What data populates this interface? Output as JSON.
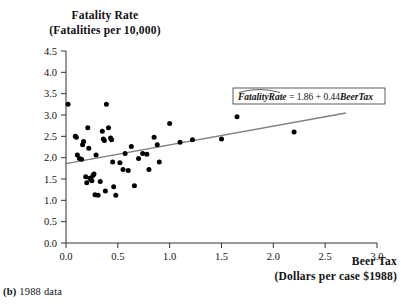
{
  "figure": {
    "caption_label": "(b)",
    "caption_text": "1988 data"
  },
  "axis_titles": {
    "y_line1": "Fatality Rate",
    "y_line2": "(Fatalities per 10,000)",
    "x_line1": "Beer Tax",
    "x_line2": "(Dollars per case $1988)"
  },
  "annotation": {
    "equation_lhs": "FatalityRate",
    "equation_rhs": " = 1.86 + 0.44",
    "equation_var": "BeerTax",
    "equation_full": "FatalityRate = 1.86 + 0.44BeerTax",
    "intercept": 1.86,
    "slope": 0.44
  },
  "colors": {
    "point": "#000000",
    "line": "#808080",
    "axis": "#333333",
    "background": "#ffffff"
  },
  "chart_data": {
    "type": "scatter",
    "title": "Fatality Rate (Fatalities per 10,000)",
    "xlabel": "Beer Tax (Dollars per case $1988)",
    "ylabel": "Fatality Rate (Fatalities per 10,000)",
    "xlim": [
      0.0,
      3.0
    ],
    "ylim": [
      0.0,
      4.5
    ],
    "xticks": [
      "0.0",
      "0.5",
      "1.0",
      "1.5",
      "2.0",
      "2.5",
      "3.0"
    ],
    "yticks": [
      "0.0",
      "0.5",
      "1.0",
      "1.5",
      "2.0",
      "2.5",
      "3.0",
      "3.5",
      "4.0",
      "4.5"
    ],
    "grid": false,
    "legend": false,
    "series": [
      {
        "name": "states",
        "marker": "filled-circle",
        "points": [
          [
            0.02,
            3.25
          ],
          [
            0.09,
            2.5
          ],
          [
            0.1,
            2.48
          ],
          [
            0.11,
            2.06
          ],
          [
            0.13,
            1.98
          ],
          [
            0.15,
            1.96
          ],
          [
            0.16,
            2.3
          ],
          [
            0.17,
            2.38
          ],
          [
            0.19,
            1.55
          ],
          [
            0.2,
            1.41
          ],
          [
            0.21,
            2.7
          ],
          [
            0.22,
            2.22
          ],
          [
            0.23,
            1.52
          ],
          [
            0.24,
            1.49
          ],
          [
            0.25,
            1.46
          ],
          [
            0.26,
            1.58
          ],
          [
            0.27,
            1.62
          ],
          [
            0.28,
            1.13
          ],
          [
            0.29,
            2.06
          ],
          [
            0.31,
            1.12
          ],
          [
            0.33,
            1.44
          ],
          [
            0.35,
            2.62
          ],
          [
            0.36,
            2.44
          ],
          [
            0.37,
            2.4
          ],
          [
            0.38,
            1.22
          ],
          [
            0.39,
            3.25
          ],
          [
            0.41,
            2.7
          ],
          [
            0.43,
            2.46
          ],
          [
            0.44,
            2.42
          ],
          [
            0.45,
            1.9
          ],
          [
            0.46,
            1.32
          ],
          [
            0.48,
            1.12
          ],
          [
            0.52,
            1.88
          ],
          [
            0.55,
            1.72
          ],
          [
            0.57,
            2.1
          ],
          [
            0.6,
            1.7
          ],
          [
            0.63,
            2.26
          ],
          [
            0.66,
            1.34
          ],
          [
            0.7,
            1.98
          ],
          [
            0.74,
            2.1
          ],
          [
            0.78,
            2.08
          ],
          [
            0.8,
            1.72
          ],
          [
            0.85,
            2.48
          ],
          [
            0.88,
            2.3
          ],
          [
            0.9,
            1.9
          ],
          [
            1.0,
            2.8
          ],
          [
            1.1,
            2.36
          ],
          [
            1.22,
            2.42
          ],
          [
            1.5,
            2.44
          ],
          [
            1.65,
            2.96
          ],
          [
            2.2,
            2.6
          ]
        ]
      }
    ],
    "fit_line": {
      "intercept": 1.86,
      "slope": 0.44,
      "x_start": 0.0,
      "x_end": 2.7,
      "label": "FatalityRate = 1.86 + 0.44BeerTax"
    }
  }
}
